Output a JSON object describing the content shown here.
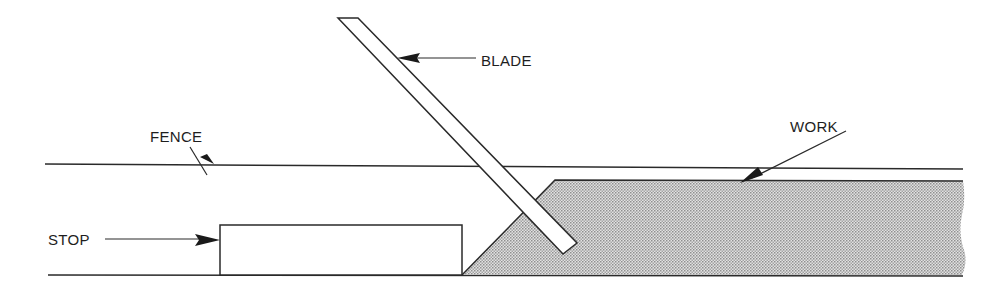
{
  "diagram": {
    "type": "technical-illustration",
    "labels": {
      "fence": "FENCE",
      "blade": "BLADE",
      "work": "WORK",
      "stop": "STOP"
    },
    "colors": {
      "line": "#2a2a2a",
      "work_fill": "#cfcfcf",
      "background": "#ffffff"
    }
  }
}
